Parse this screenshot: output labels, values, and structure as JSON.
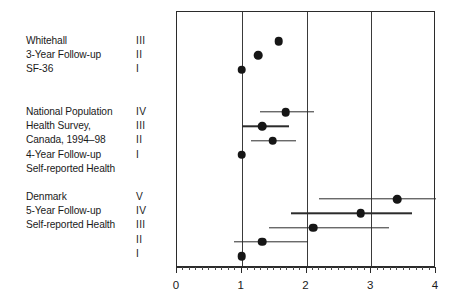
{
  "chart_data": {
    "type": "scatter",
    "title": "",
    "xlabel": "",
    "ylabel": "",
    "xlim": [
      0,
      4
    ],
    "grid": true,
    "gridlines_x": [
      1,
      2,
      3
    ],
    "xticks": [
      0,
      1,
      2,
      3,
      4
    ],
    "xtick_labels": [
      "0",
      "1",
      "2",
      "3",
      "4"
    ],
    "minor_tick_step": 0.1,
    "reference_value": 1,
    "groups": [
      {
        "name": "Whitehall 3-Year Follow-up SF-36",
        "label_lines": [
          "Whitehall",
          "3-Year Follow-up",
          "SF-36"
        ],
        "numerals": [
          "III",
          "II",
          "I"
        ],
        "points": [
          {
            "level": "III",
            "estimate": 1.57,
            "ci_low": null,
            "ci_high": null
          },
          {
            "level": "II",
            "estimate": 1.25,
            "ci_low": null,
            "ci_high": null
          },
          {
            "level": "I",
            "estimate": 1.0,
            "ci_low": null,
            "ci_high": null
          }
        ]
      },
      {
        "name": "National Population Health Survey, Canada, 1994-98 4-Year Follow-up Self-reported Health",
        "label_lines": [
          "National Population",
          "Health Survey,",
          "Canada, 1994–98",
          "4-Year Follow-up",
          "Self-reported Health"
        ],
        "numerals": [
          "IV",
          "III",
          "II",
          "I"
        ],
        "points": [
          {
            "level": "IV",
            "estimate": 1.68,
            "ci_low": 1.28,
            "ci_high": 2.11
          },
          {
            "level": "III",
            "estimate": 1.32,
            "ci_low": 1.0,
            "ci_high": 1.73
          },
          {
            "level": "II",
            "estimate": 1.48,
            "ci_low": 1.15,
            "ci_high": 1.84
          },
          {
            "level": "I",
            "estimate": 1.0,
            "ci_low": null,
            "ci_high": null
          }
        ]
      },
      {
        "name": "Denmark 5-Year Follow-up Self-reported Health",
        "label_lines": [
          "Denmark",
          "5-Year Follow-up",
          "Self-reported Health"
        ],
        "numerals": [
          "V",
          "IV",
          "III",
          "II",
          "I"
        ],
        "points": [
          {
            "level": "V",
            "estimate": 3.4,
            "ci_low": 2.19,
            "ci_high": 4.0
          },
          {
            "level": "IV",
            "estimate": 2.84,
            "ci_low": 1.76,
            "ci_high": 3.63
          },
          {
            "level": "III",
            "estimate": 2.1,
            "ci_low": 1.42,
            "ci_high": 3.27
          },
          {
            "level": "II",
            "estimate": 1.32,
            "ci_low": 0.88,
            "ci_high": 2.02
          },
          {
            "level": "I",
            "estimate": 1.0,
            "ci_low": null,
            "ci_high": null
          }
        ]
      }
    ]
  },
  "colors": {
    "marker": "#161616",
    "axis": "#2b2b2b",
    "grid": "#3a3a3a",
    "background": "#ffffff"
  },
  "layout": {
    "plot_left_px": 176,
    "plot_top_px": 11,
    "plot_width_px": 259,
    "plot_height_px": 256,
    "group_label_tops_px": [
      34,
      105,
      190
    ],
    "group_row_tops_px": [
      40,
      111,
      198
    ],
    "row_spacing_px": 14.3
  }
}
